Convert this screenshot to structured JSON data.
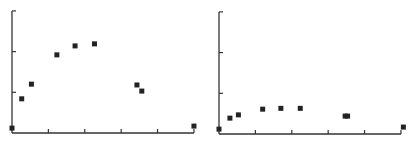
{
  "chart_data": [
    {
      "type": "scatter",
      "title": "",
      "xlabel": "",
      "ylabel": "",
      "xlim": [
        0,
        15
      ],
      "ylim": [
        0,
        3
      ],
      "x_ticks": [
        0,
        3,
        6,
        9,
        12,
        15
      ],
      "y_ticks": [
        0,
        1,
        2,
        3
      ],
      "tick_labels_visible": false,
      "grid": false,
      "legend": null,
      "series": [
        {
          "name": "left-panel",
          "color": "#222222",
          "marker": "square",
          "x": [
            0.0,
            0.8,
            1.6,
            3.7,
            5.2,
            6.8,
            10.3,
            10.7,
            15.0
          ],
          "y": [
            0.12,
            0.84,
            1.2,
            1.92,
            2.14,
            2.19,
            1.18,
            1.03,
            0.17
          ]
        }
      ]
    },
    {
      "type": "scatter",
      "title": "",
      "xlabel": "",
      "ylabel": "",
      "xlim": [
        0,
        15
      ],
      "ylim": [
        0,
        3
      ],
      "x_ticks": [
        0,
        3,
        6,
        9,
        12,
        15
      ],
      "y_ticks": [
        0,
        1,
        2,
        3
      ],
      "tick_labels_visible": false,
      "grid": false,
      "legend": null,
      "series": [
        {
          "name": "right-panel",
          "color": "#222222",
          "marker": "square",
          "x": [
            0.0,
            0.9,
            1.6,
            3.6,
            5.1,
            6.7,
            10.4,
            10.6,
            15.2
          ],
          "y": [
            0.12,
            0.39,
            0.47,
            0.61,
            0.63,
            0.63,
            0.44,
            0.44,
            0.17
          ]
        }
      ]
    }
  ],
  "panels": [
    {
      "origin_px": [
        12,
        133
      ],
      "x_px_per_unit": 12.13,
      "y_px_per_unit": 40.7,
      "x_end_px": 194,
      "y_top_px": 11
    },
    {
      "origin_px": [
        219,
        134
      ],
      "x_px_per_unit": 12.13,
      "y_px_per_unit": 40.7,
      "x_end_px": 401,
      "y_top_px": 12
    }
  ],
  "style": {
    "axis_color": "#333333",
    "marker_color": "#222222",
    "background": "#ffffff"
  }
}
